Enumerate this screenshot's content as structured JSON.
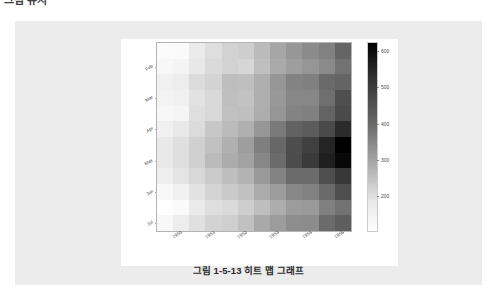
{
  "page": {
    "top_cut_text": "그림 유지",
    "background_color": "#ffffff",
    "panel_color": "#ececec",
    "canvas_color": "#ffffff"
  },
  "caption": {
    "text": "그림 1-5-13 히트 맵 그래프"
  },
  "chart_data": {
    "type": "heatmap",
    "title": "",
    "xlabel": "",
    "ylabel": "",
    "grid": false,
    "legend_position": "right",
    "colormap": "grayscale-reversed",
    "x_tick_labels": [
      "1950",
      "1951",
      "1952",
      "1953",
      "1954",
      "1955"
    ],
    "x_tick_positions": [
      1,
      3,
      5,
      7,
      9,
      11
    ],
    "x_categories": [
      "1949",
      "1950",
      "1951",
      "1952",
      "1953",
      "1954",
      "1955",
      "1956",
      "1957",
      "1958",
      "1959",
      "1960"
    ],
    "y_tick_labels": [
      "Feb",
      "Mar",
      "Apr",
      "May",
      "Jun",
      "Jul"
    ],
    "y_tick_positions": [
      1,
      3,
      5,
      7,
      9,
      11
    ],
    "y_categories": [
      "Jan",
      "Feb",
      "Mar",
      "Apr",
      "May",
      "Jun",
      "Jul",
      "Aug",
      "Sep",
      "Oct",
      "Nov",
      "Dec"
    ],
    "colorbar": {
      "ticks": [
        200,
        300,
        400,
        500,
        600
      ],
      "vmin": 104,
      "vmax": 622,
      "low_color": "#ffffff",
      "high_color": "#000000"
    },
    "values": [
      [
        112,
        115,
        145,
        171,
        196,
        204,
        242,
        284,
        315,
        340,
        360,
        417
      ],
      [
        118,
        126,
        150,
        180,
        196,
        188,
        233,
        277,
        301,
        318,
        342,
        391
      ],
      [
        132,
        141,
        178,
        193,
        236,
        235,
        267,
        317,
        356,
        362,
        406,
        419
      ],
      [
        129,
        135,
        163,
        181,
        235,
        227,
        269,
        313,
        348,
        348,
        396,
        461
      ],
      [
        121,
        125,
        172,
        183,
        229,
        234,
        270,
        318,
        355,
        363,
        420,
        472
      ],
      [
        135,
        149,
        178,
        218,
        243,
        264,
        315,
        374,
        422,
        435,
        472,
        535
      ],
      [
        148,
        170,
        199,
        230,
        264,
        302,
        364,
        413,
        465,
        491,
        548,
        622
      ],
      [
        148,
        170,
        199,
        242,
        272,
        293,
        347,
        405,
        467,
        505,
        559,
        606
      ],
      [
        136,
        158,
        184,
        209,
        237,
        259,
        312,
        355,
        404,
        404,
        463,
        508
      ],
      [
        119,
        133,
        162,
        191,
        211,
        229,
        274,
        306,
        347,
        359,
        407,
        461
      ],
      [
        104,
        114,
        146,
        172,
        180,
        203,
        237,
        271,
        305,
        310,
        362,
        390
      ],
      [
        118,
        140,
        166,
        194,
        201,
        229,
        278,
        306,
        336,
        337,
        405,
        432
      ]
    ]
  }
}
